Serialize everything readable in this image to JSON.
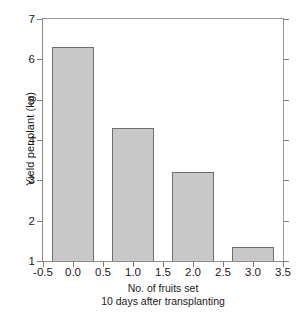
{
  "chart_data": {
    "type": "bar",
    "title": "",
    "xlabel": "No. of fruits set 10 days after transplanting",
    "xlabel_lines": [
      "No. of fruits set",
      "10 days after transplanting"
    ],
    "ylabel": "Yield per plant (kg)",
    "categories": [
      "0.0",
      "1.0",
      "2.0",
      "3.0"
    ],
    "x": [
      0.0,
      1.0,
      2.0,
      3.0
    ],
    "values": [
      6.3,
      4.3,
      3.2,
      1.35
    ],
    "xlim": [
      -0.5,
      3.5
    ],
    "ylim": [
      1,
      7
    ],
    "x_ticks": [
      -0.5,
      0.0,
      0.5,
      1.0,
      1.5,
      2.0,
      2.5,
      3.0,
      3.5
    ],
    "x_tick_labels": [
      "-0.5",
      "0.0",
      "0.5",
      "1.0",
      "1.5",
      "2.0",
      "2.5",
      "3.0",
      "3.5"
    ],
    "y_ticks": [
      1,
      2,
      3,
      4,
      5,
      6,
      7
    ],
    "y_tick_labels": [
      "1",
      "2",
      "3",
      "4",
      "5",
      "6",
      "7"
    ],
    "bar_width": 0.7,
    "grid": false,
    "legend": null,
    "colors": {
      "bar_fill": "#c8c8c8",
      "bar_edge": "#6e6e6e",
      "axis": "#8b8b8b",
      "text": "#1a1a1a",
      "background": "#ffffff"
    }
  }
}
